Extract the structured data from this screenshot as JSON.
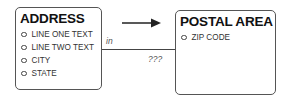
{
  "diagram": {
    "entities": [
      {
        "name": "ADDRESS",
        "attributes": [
          "LINE ONE TEXT",
          "LINE TWO TEXT",
          "CITY",
          "STATE"
        ]
      },
      {
        "name": "POSTAL AREA",
        "attributes": [
          "ZIP CODE"
        ]
      }
    ],
    "relationship": {
      "from_label": "in",
      "to_label": "???",
      "direction": "ADDRESS → POSTAL AREA"
    },
    "colors": {
      "line": "#444444",
      "border": "#555555",
      "label": "#555555"
    }
  }
}
